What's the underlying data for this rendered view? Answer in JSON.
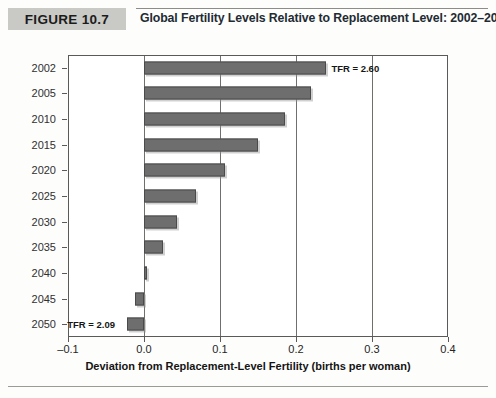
{
  "figure": {
    "badge_label": "FIGURE 10.7",
    "title": "Global Fertility Levels Relative to Replacement Level: 2002–2050"
  },
  "chart_data": {
    "type": "bar",
    "orientation": "horizontal",
    "title": "Global Fertility Levels Relative to Replacement Level: 2002–2050",
    "xlabel": "Deviation from Replacement-Level Fertility (births per woman)",
    "ylabel": "",
    "xlim": [
      -0.1,
      0.4
    ],
    "xticks": [
      -0.1,
      0.0,
      0.1,
      0.2,
      0.3,
      0.4
    ],
    "xticklabels": [
      "–0.1",
      "0.0",
      "0.1",
      "0.2",
      "0.3",
      "0.4"
    ],
    "grid": true,
    "legend": null,
    "bar_color": "#6e6e6e",
    "categories": [
      "2002",
      "2005",
      "2010",
      "2015",
      "2020",
      "2025",
      "2030",
      "2035",
      "2040",
      "2045",
      "2050"
    ],
    "values": [
      0.24,
      0.22,
      0.185,
      0.15,
      0.107,
      0.069,
      0.044,
      0.025,
      0.003,
      -0.012,
      -0.022
    ],
    "annotations": [
      {
        "text": "TFR = 2.60",
        "category": "2002",
        "position": "right-of-bar"
      },
      {
        "text": "TFR = 2.09",
        "category": "2050",
        "position": "left-of-bar"
      }
    ]
  }
}
